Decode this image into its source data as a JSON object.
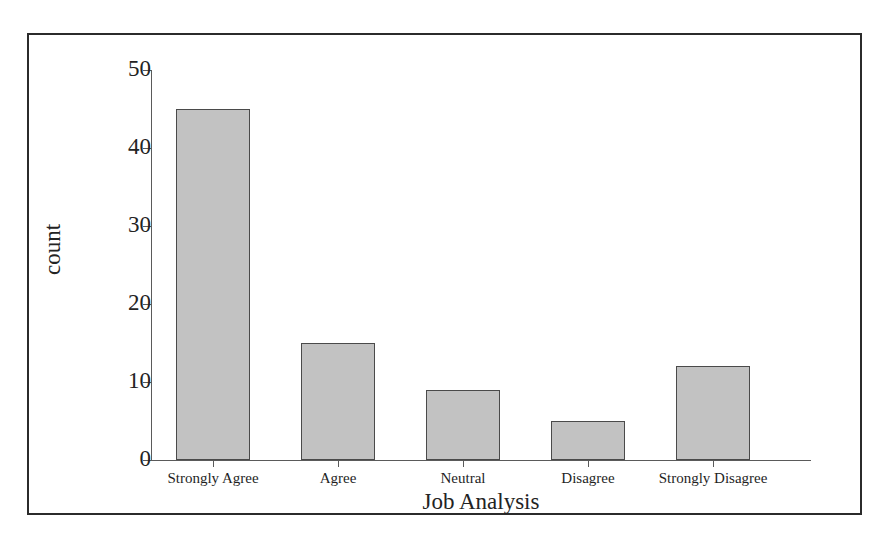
{
  "chart_data": {
    "type": "bar",
    "title": "",
    "subtitle": "",
    "xlabel": "Job Analysis",
    "ylabel": "count",
    "categories": [
      "Strongly Agree",
      "Agree",
      "Neutral",
      "Disagree",
      "Strongly Disagree"
    ],
    "values": [
      45,
      15,
      9,
      5,
      12
    ],
    "series": [
      {
        "name": "count",
        "values": [
          45,
          15,
          9,
          5,
          12
        ]
      }
    ],
    "ylim": [
      0,
      50
    ],
    "y_ticks": [
      0,
      10,
      20,
      30,
      40,
      50
    ],
    "y_tick_labels": [
      "0",
      "10",
      "20",
      "30",
      "40",
      "50"
    ],
    "grid": false,
    "legend": false,
    "legend_position": "none",
    "bar_fill_color": "#c2c2c2",
    "bar_edge_color": "#4a4a4a",
    "axis_color": "#5a5a5a",
    "frame_color": "#2b2b2b",
    "background_color": "#ffffff",
    "text_color": "#232323"
  }
}
